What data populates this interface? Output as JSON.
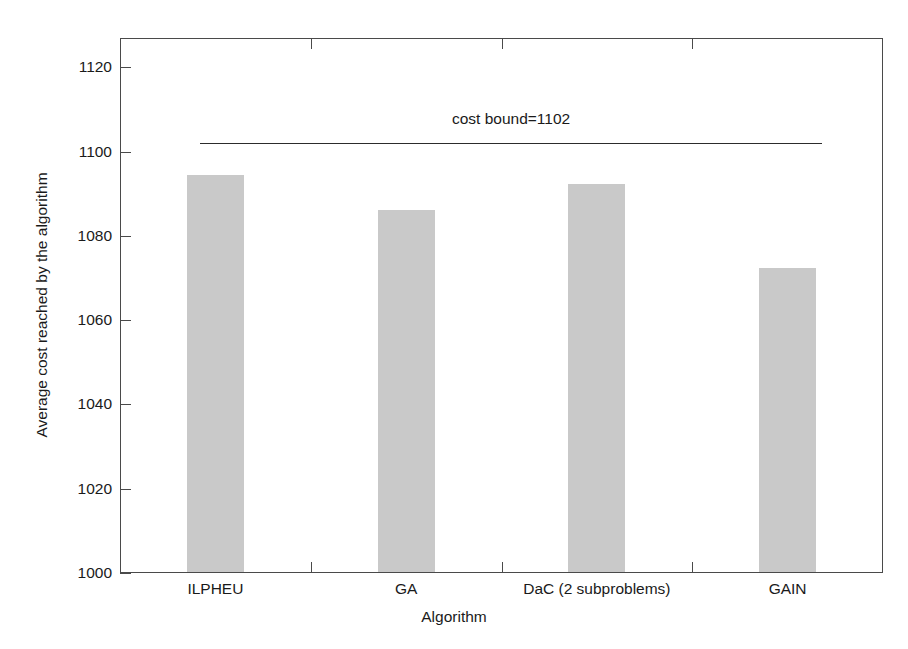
{
  "chart_data": {
    "type": "bar",
    "title": "",
    "subtitle": "",
    "xlabel": "Algorithm",
    "ylabel": "Average cost reached by the algorithm",
    "categories": [
      "ILPHEU",
      "GA",
      "DaC (2 subproblems)",
      "GAIN"
    ],
    "values": [
      1094.5,
      1086.2,
      1092.3,
      1072.5
    ],
    "ylim": [
      1000,
      1127
    ],
    "xlim": [
      0,
      4
    ],
    "ytick_labels": [
      "1000",
      "1020",
      "1040",
      "1060",
      "1080",
      "1100",
      "1120"
    ],
    "ytick_values": [
      1000,
      1020,
      1040,
      1060,
      1080,
      1100,
      1120
    ],
    "grid": false,
    "legend": null,
    "bar_color": "#c9c9c9",
    "axis_color": "#4a4a4a",
    "annotations": [
      {
        "name": "cost-bound",
        "text": "cost bound=1102",
        "value": 1102,
        "line_x_start": 0.42,
        "line_x_end": 3.68,
        "label_x": 2.05
      }
    ]
  },
  "clipped_top_text": "",
  "icons": {}
}
